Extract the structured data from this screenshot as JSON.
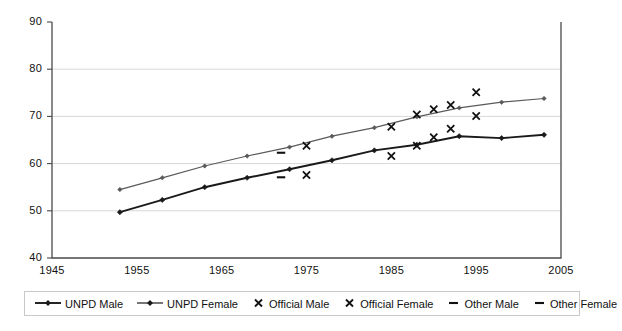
{
  "chart_data": {
    "type": "line",
    "title": "",
    "xlabel": "",
    "ylabel": "",
    "xlim": [
      1945,
      2005
    ],
    "ylim": [
      40,
      90
    ],
    "xticks": [
      1945,
      1955,
      1965,
      1975,
      1985,
      1995,
      2005
    ],
    "yticks": [
      40,
      50,
      60,
      70,
      80,
      90
    ],
    "grid": "horizontal",
    "legend_position": "bottom",
    "series": [
      {
        "name": "UNPD Male",
        "style": "line-marker",
        "color": "#1a1a1a",
        "x": [
          1953,
          1958,
          1963,
          1968,
          1973,
          1978,
          1983,
          1988,
          1993,
          1998,
          2003
        ],
        "values": [
          49.7,
          52.3,
          55.0,
          57.0,
          58.8,
          60.7,
          62.8,
          64.0,
          65.8,
          65.4,
          66.1
        ]
      },
      {
        "name": "UNPD Female",
        "style": "line-marker",
        "color": "#5a5a5a",
        "x": [
          1953,
          1958,
          1963,
          1968,
          1973,
          1978,
          1983,
          1988,
          1993,
          1998,
          2003
        ],
        "values": [
          54.5,
          57.0,
          59.5,
          61.6,
          63.5,
          65.8,
          67.6,
          69.9,
          71.8,
          73.0,
          73.8
        ]
      },
      {
        "name": "Official Male",
        "style": "x-marker",
        "color": "#111111",
        "x": [
          1975,
          1985,
          1988,
          1990,
          1992,
          1995
        ],
        "values": [
          57.6,
          61.6,
          63.8,
          65.6,
          67.4,
          70.1
        ]
      },
      {
        "name": "Official Female",
        "style": "x-marker",
        "color": "#111111",
        "x": [
          1975,
          1985,
          1988,
          1990,
          1992,
          1995
        ],
        "values": [
          63.8,
          67.8,
          70.4,
          71.5,
          72.4,
          75.1
        ]
      },
      {
        "name": "Other Male",
        "style": "dash-marker",
        "color": "#111111",
        "x": [
          1972
        ],
        "values": [
          57.1
        ]
      },
      {
        "name": "Other Female",
        "style": "dash-marker",
        "color": "#111111",
        "x": [
          1972
        ],
        "values": [
          62.3
        ]
      }
    ]
  },
  "axes": {
    "y_tick_labels": [
      "90",
      "80",
      "70",
      "60",
      "50",
      "40"
    ],
    "x_tick_labels": [
      "1945",
      "1955",
      "1965",
      "1975",
      "1985",
      "1995",
      "2005"
    ]
  },
  "legend": {
    "items": [
      {
        "label": "UNPD Male",
        "marker": "line-diamond-icon"
      },
      {
        "label": "UNPD Female",
        "marker": "line-diamond-icon"
      },
      {
        "label": "Official Male",
        "marker": "cross-x-icon"
      },
      {
        "label": "Official Female",
        "marker": "cross-x-icon"
      },
      {
        "label": "Other Male",
        "marker": "dash-icon"
      },
      {
        "label": "Other Female",
        "marker": "dash-icon"
      }
    ]
  }
}
